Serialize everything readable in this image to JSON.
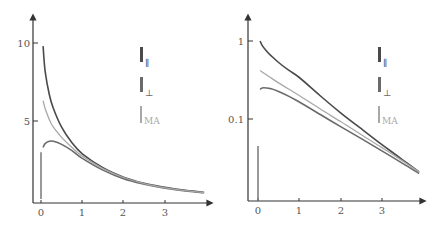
{
  "chart_data": [
    {
      "type": "line",
      "title": "",
      "xlabel": "",
      "ylabel": "",
      "yscale": "linear",
      "xlim": [
        -0.2,
        4.1
      ],
      "ylim": [
        0,
        11.5
      ],
      "grid": false,
      "legend_position": "upper-right",
      "x_ticks": [
        "0",
        "1",
        "2",
        "3"
      ],
      "y_ticks": [
        "5",
        "10"
      ],
      "x": [
        0.05,
        0.1,
        0.2,
        0.3,
        0.5,
        0.75,
        1.0,
        1.5,
        2.0,
        2.5,
        3.0,
        3.5,
        3.95
      ],
      "series": [
        {
          "name": "I∥",
          "color": "#4a4a4a",
          "values": [
            9.8,
            8.2,
            6.7,
            5.8,
            4.6,
            3.6,
            2.9,
            2.0,
            1.4,
            1.0,
            0.75,
            0.55,
            0.42
          ]
        },
        {
          "name": "I⊥",
          "color": "#6a6a6a",
          "values": [
            3.3,
            3.55,
            3.7,
            3.7,
            3.5,
            3.1,
            2.6,
            1.85,
            1.3,
            0.95,
            0.7,
            0.52,
            0.4
          ]
        },
        {
          "name": "IMA",
          "color": "#a8a8a8",
          "values": [
            6.3,
            5.8,
            5.1,
            4.6,
            3.95,
            3.3,
            2.75,
            1.95,
            1.38,
            0.98,
            0.72,
            0.54,
            0.41
          ]
        }
      ],
      "spike": {
        "x": 0.0,
        "from": 0,
        "to": 3.0
      }
    },
    {
      "type": "line",
      "title": "",
      "xlabel": "",
      "ylabel": "",
      "yscale": "log",
      "xlim": [
        -0.2,
        4.1
      ],
      "ylim": [
        0.009,
        2.2
      ],
      "grid": false,
      "legend_position": "upper-right",
      "x_ticks": [
        "0",
        "1",
        "2",
        "3"
      ],
      "y_ticks": [
        "0.1",
        "1"
      ],
      "x": [
        0.05,
        0.1,
        0.2,
        0.3,
        0.5,
        0.75,
        1.0,
        1.5,
        2.0,
        2.5,
        3.0,
        3.5,
        3.9
      ],
      "series": [
        {
          "name": "I∥",
          "color": "#4a4a4a",
          "values": [
            1.0,
            0.88,
            0.75,
            0.66,
            0.53,
            0.42,
            0.34,
            0.2,
            0.12,
            0.075,
            0.047,
            0.03,
            0.021
          ]
        },
        {
          "name": "I⊥",
          "color": "#6a6a6a",
          "values": [
            0.24,
            0.25,
            0.25,
            0.245,
            0.225,
            0.195,
            0.165,
            0.115,
            0.08,
            0.056,
            0.039,
            0.027,
            0.02
          ]
        },
        {
          "name": "IMA",
          "color": "#a8a8a8",
          "values": [
            0.42,
            0.4,
            0.37,
            0.34,
            0.29,
            0.24,
            0.2,
            0.135,
            0.093,
            0.063,
            0.043,
            0.029,
            0.021
          ]
        }
      ],
      "spike": {
        "x": 0.0,
        "from": 0.009,
        "to": 0.045
      }
    }
  ],
  "legend": {
    "items": [
      {
        "symbol": "I",
        "subscript": "∥",
        "color": "#4a4a4a"
      },
      {
        "symbol": "I",
        "subscript": "⊥",
        "color": "#6a6a6a"
      },
      {
        "symbol": "I",
        "subscript": "MA",
        "color": "#a8a8a8"
      }
    ]
  },
  "left_axis": {
    "y_tick_labels": [
      "10",
      "5"
    ],
    "x_tick_labels": [
      "0",
      "1",
      "2",
      "3"
    ]
  },
  "right_axis": {
    "y_tick_labels": [
      "1",
      "0.1"
    ],
    "x_tick_labels": [
      "0",
      "1",
      "2",
      "3"
    ]
  }
}
